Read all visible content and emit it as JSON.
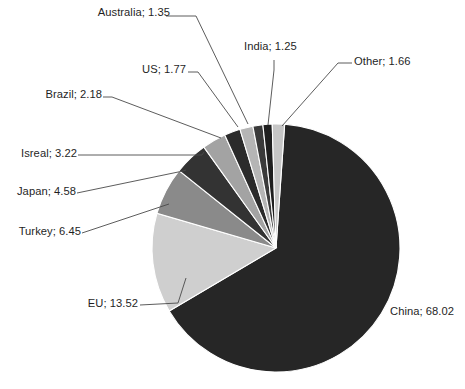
{
  "chart_data": {
    "type": "pie",
    "title": "",
    "subtitle": "",
    "xlabel": "",
    "ylabel": "",
    "legend_position": "none",
    "label_format": "name; value",
    "label_separator": "; ",
    "grid": false,
    "total": 104.0,
    "start_angle_deg": 4,
    "direction": "clockwise",
    "categories": [
      "China",
      "EU",
      "Turkey",
      "Japan",
      "Isreal",
      "Brazil",
      "US",
      "Australia",
      "India",
      "Other"
    ],
    "values": [
      68.02,
      13.52,
      6.45,
      4.58,
      3.22,
      2.18,
      1.77,
      1.35,
      1.25,
      1.66
    ],
    "slices": [
      {
        "name": "China",
        "value": 68.02,
        "label": "China; 68.02",
        "color": "#262626",
        "truncated": true
      },
      {
        "name": "EU",
        "value": 13.52,
        "label": "EU; 13.52",
        "color": "#cfcfcf",
        "truncated": false
      },
      {
        "name": "Turkey",
        "value": 6.45,
        "label": "Turkey; 6.45",
        "color": "#8a8a8a",
        "truncated": false
      },
      {
        "name": "Japan",
        "value": 4.58,
        "label": "Japan; 4.58",
        "color": "#333333",
        "truncated": false
      },
      {
        "name": "Isreal",
        "value": 3.22,
        "label": "Isreal; 3.22",
        "color": "#a3a3a3",
        "truncated": false
      },
      {
        "name": "Brazil",
        "value": 2.18,
        "label": "Brazil; 2.18",
        "color": "#2b2b2b",
        "truncated": false
      },
      {
        "name": "US",
        "value": 1.77,
        "label": "US; 1.77",
        "color": "#b5b5b5",
        "truncated": false
      },
      {
        "name": "Australia",
        "value": 1.35,
        "label": "Australia; 1.35",
        "color": "#3a3a3a",
        "truncated": false
      },
      {
        "name": "India",
        "value": 1.25,
        "label": "India; 1.25",
        "color": "#1f1f1f",
        "truncated": false
      },
      {
        "name": "Other",
        "value": 1.66,
        "label": "Other; 1.66",
        "color": "#c6c6c6",
        "truncated": false
      }
    ]
  },
  "labels": {
    "china": "China; 68.02",
    "china_visible": "China; 68.0",
    "eu": "EU; 13.52",
    "turkey": "Turkey; 6.45",
    "japan": "Japan; 4.58",
    "isreal": "Isreal; 3.22",
    "brazil": "Brazil; 2.18",
    "us": "US; 1.77",
    "australia": "Australia; 1.35",
    "india": "India; 1.25",
    "other": "Other; 1.66"
  },
  "style": {
    "background": "#ffffff",
    "label_color": "#1f1f1f",
    "leader_color": "#4a4a4a",
    "slice_border": "#ffffff"
  }
}
